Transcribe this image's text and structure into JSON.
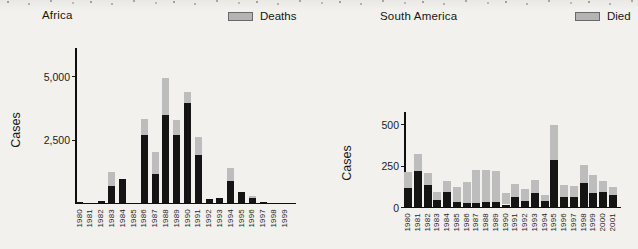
{
  "figure": {
    "background": "#f2f1ee",
    "bar_color": "#141414",
    "cap_color": "#bdbdbd",
    "axis_color": "#0f0f0f"
  },
  "chart_data": [
    {
      "type": "bar",
      "title": "Africa",
      "legend_label": "Deaths",
      "legend_position": "top-right",
      "legend_color": "#b4b4b4",
      "ylabel": "Cases",
      "xlabel": "",
      "ylim": [
        0,
        5300
      ],
      "grid": false,
      "ytick_values": [
        2500,
        5000
      ],
      "ytick_labels": [
        "2,500",
        "5,000"
      ],
      "categories": [
        "1980",
        "1981",
        "1982",
        "1983",
        "1984",
        "1985",
        "1986",
        "1987",
        "1988",
        "1989",
        "1990",
        "1991",
        "1992",
        "1993",
        "1994",
        "1995",
        "1996",
        "1997",
        "1998",
        "1999"
      ],
      "series": [
        {
          "name": "Cases",
          "values": [
            50,
            10,
            100,
            1250,
            950,
            0,
            3340,
            2040,
            4950,
            3280,
            4380,
            2600,
            170,
            230,
            1390,
            460,
            300,
            60,
            0,
            0
          ]
        },
        {
          "name": "Deaths",
          "values": [
            0,
            0,
            0,
            550,
            0,
            0,
            640,
            890,
            1480,
            580,
            420,
            700,
            0,
            0,
            520,
            0,
            100,
            0,
            0,
            0
          ]
        }
      ]
    },
    {
      "type": "bar",
      "title": "South America",
      "legend_label": "Died",
      "legend_position": "top-right",
      "legend_color": "#b4b4b4",
      "ylabel": "Cases",
      "xlabel": "",
      "ylim": [
        0,
        560
      ],
      "grid": false,
      "ytick_values": [
        0,
        250,
        500
      ],
      "ytick_labels": [
        "0",
        "250",
        "500"
      ],
      "categories": [
        "1980",
        "1981",
        "1982",
        "1983",
        "1984",
        "1985",
        "1986",
        "1987",
        "1988",
        "1989",
        "1990",
        "1991",
        "1992",
        "1993",
        "1994",
        "1995",
        "1996",
        "1997",
        "1998",
        "1999",
        "2000",
        "2001"
      ],
      "series": [
        {
          "name": "Cases",
          "values": [
            215,
            320,
            210,
            95,
            160,
            125,
            155,
            228,
            228,
            218,
            85,
            142,
            112,
            165,
            78,
            500,
            135,
            130,
            258,
            195,
            158,
            125
          ]
        },
        {
          "name": "Died",
          "values": [
            100,
            100,
            75,
            47,
            65,
            90,
            127,
            200,
            196,
            185,
            67,
            77,
            74,
            80,
            36,
            215,
            72,
            68,
            108,
            105,
            65,
            50
          ]
        }
      ]
    }
  ]
}
